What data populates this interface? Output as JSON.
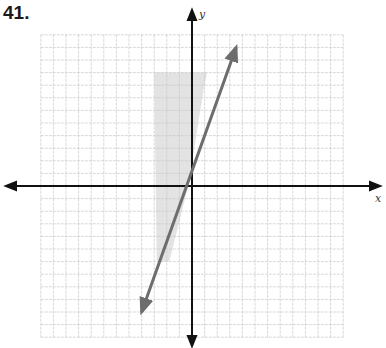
{
  "problem": {
    "number": "41."
  },
  "chart_data": {
    "type": "line",
    "title": "",
    "xlabel": "x",
    "ylabel": "y",
    "xlim": [
      -12,
      12
    ],
    "ylim": [
      -12,
      12
    ],
    "grid": true,
    "grid_step": 1,
    "series": [
      {
        "name": "line",
        "equation": "y = 3x + 1",
        "endpoints": [
          [
            -4,
            -10
          ],
          [
            3.5,
            11
          ]
        ],
        "arrows": "both",
        "color": "#6d6d6d"
      }
    ],
    "shaded_region": {
      "description": "light gray strip left of the line, roughly x from -3 to the line, y from -6 to 9",
      "approx_bounds": {
        "x": [
          -3,
          1.5
        ],
        "y": [
          -6,
          9
        ]
      },
      "color": "#e3e3e3"
    }
  },
  "labels": {
    "x_axis": "x",
    "y_axis": "y"
  },
  "colors": {
    "grid": "#c9c9c9",
    "axes": "#111111",
    "line": "#6d6d6d",
    "shade": "#e3e3e3"
  }
}
